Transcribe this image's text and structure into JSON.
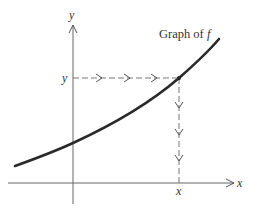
{
  "diagram": {
    "type": "function-graph",
    "curve_label": "Graph of ",
    "curve_label_var": "f",
    "y_axis_label": "y",
    "x_axis_label": "x",
    "y_value_label": "y",
    "x_value_label": "x",
    "colors": {
      "curve": "#2a2a2a",
      "axis": "#666666",
      "dashed": "#777777",
      "text": "#333333",
      "background": "#ffffff"
    }
  }
}
